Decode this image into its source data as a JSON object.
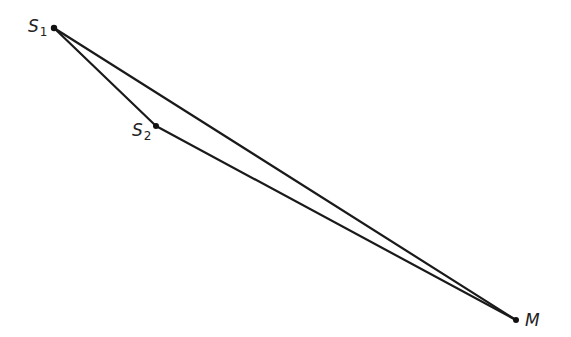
{
  "diagram": {
    "type": "geometric-figure",
    "points": [
      {
        "id": "S1",
        "label_main": "S",
        "label_sub": "1",
        "x": 54,
        "y": 28
      },
      {
        "id": "S2",
        "label_main": "S",
        "label_sub": "2",
        "x": 156,
        "y": 126
      },
      {
        "id": "M",
        "label_main": "M",
        "label_sub": "",
        "x": 516,
        "y": 320
      }
    ],
    "segments": [
      {
        "from": "S1",
        "to": "M"
      },
      {
        "from": "S1",
        "to": "S2"
      },
      {
        "from": "S2",
        "to": "M"
      }
    ],
    "colors": {
      "line": "#1a1a1a",
      "point": "#111111",
      "label": "#222222",
      "background": "#ffffff"
    }
  }
}
